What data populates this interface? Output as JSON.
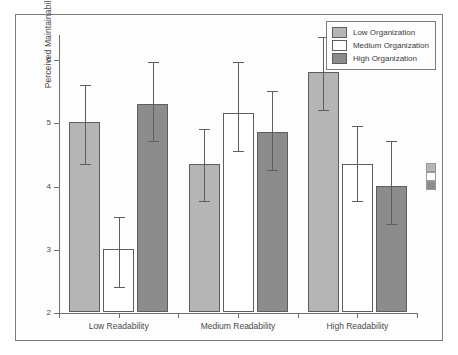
{
  "chart_data": {
    "type": "bar",
    "title": "",
    "xlabel": "",
    "ylabel": "Perceived Maintainability",
    "ylim": [
      2,
      6.4
    ],
    "yticks": [
      2,
      3,
      4,
      5,
      6
    ],
    "ytick_labels": [
      "2",
      "3",
      "4",
      "5",
      "6"
    ],
    "grid": false,
    "legend_position": "top-right",
    "error_bars": "95% CI",
    "categories": [
      "Low Readability",
      "Medium Readability",
      "High Readability"
    ],
    "series": [
      {
        "name": "Low Organization",
        "color": "#b5b5b5",
        "values": [
          5.0,
          4.35,
          5.8
        ],
        "err_low": [
          4.35,
          3.75,
          5.2
        ],
        "err_high": [
          5.6,
          4.9,
          6.35
        ]
      },
      {
        "name": "Medium Organization",
        "color": "#ffffff",
        "values": [
          3.0,
          5.15,
          4.35
        ],
        "err_low": [
          2.4,
          4.55,
          3.75
        ],
        "err_high": [
          3.5,
          5.95,
          4.95
        ]
      },
      {
        "name": "High Organization",
        "color": "#8c8c8c",
        "values": [
          5.3,
          4.85,
          4.0
        ],
        "err_low": [
          4.7,
          4.25,
          3.4
        ],
        "err_high": [
          5.95,
          5.5,
          4.7
        ]
      }
    ]
  },
  "axes": {
    "y_title": "Perceived Maintainability",
    "y_ticks": [
      "6",
      "5",
      "4",
      "3",
      "2"
    ],
    "x_ticks": [
      "Low Readability",
      "Medium Readability",
      "High Readability"
    ]
  },
  "legend": {
    "items": [
      {
        "label": "Low Organization",
        "swatch": "low"
      },
      {
        "label": "Medium Organization",
        "swatch": "med"
      },
      {
        "label": "High Organization",
        "swatch": "high"
      }
    ]
  }
}
